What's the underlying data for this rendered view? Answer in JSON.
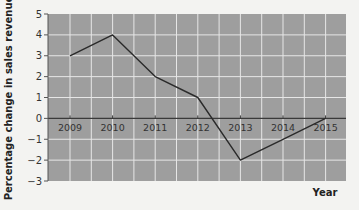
{
  "chart_data": {
    "type": "line",
    "title": "",
    "xlabel": "Year",
    "ylabel": "Percentage change in sales revenue",
    "categories": [
      "2009",
      "2010",
      "2011",
      "2012",
      "2013",
      "2014",
      "2015"
    ],
    "series": [
      {
        "name": "Percentage change in sales revenue",
        "values": [
          3,
          4,
          2,
          1,
          -2,
          -1,
          0
        ]
      }
    ],
    "ylim": [
      -3,
      5
    ],
    "yticks": [
      5,
      4,
      3,
      2,
      1,
      0,
      -1,
      -2,
      -3
    ],
    "ytick_labels": [
      "5",
      "4",
      "3",
      "2",
      "1",
      "0",
      "−1",
      "−2",
      "−3"
    ],
    "grid": true,
    "legend": null
  },
  "colors": {
    "page_background": "#f3f3f1",
    "plot_background": "#9e9e9e",
    "gridline": "#e6e6e6",
    "zero_line": "#3a3a3a",
    "series_line": "#2a2a2a",
    "text": "#333333"
  }
}
